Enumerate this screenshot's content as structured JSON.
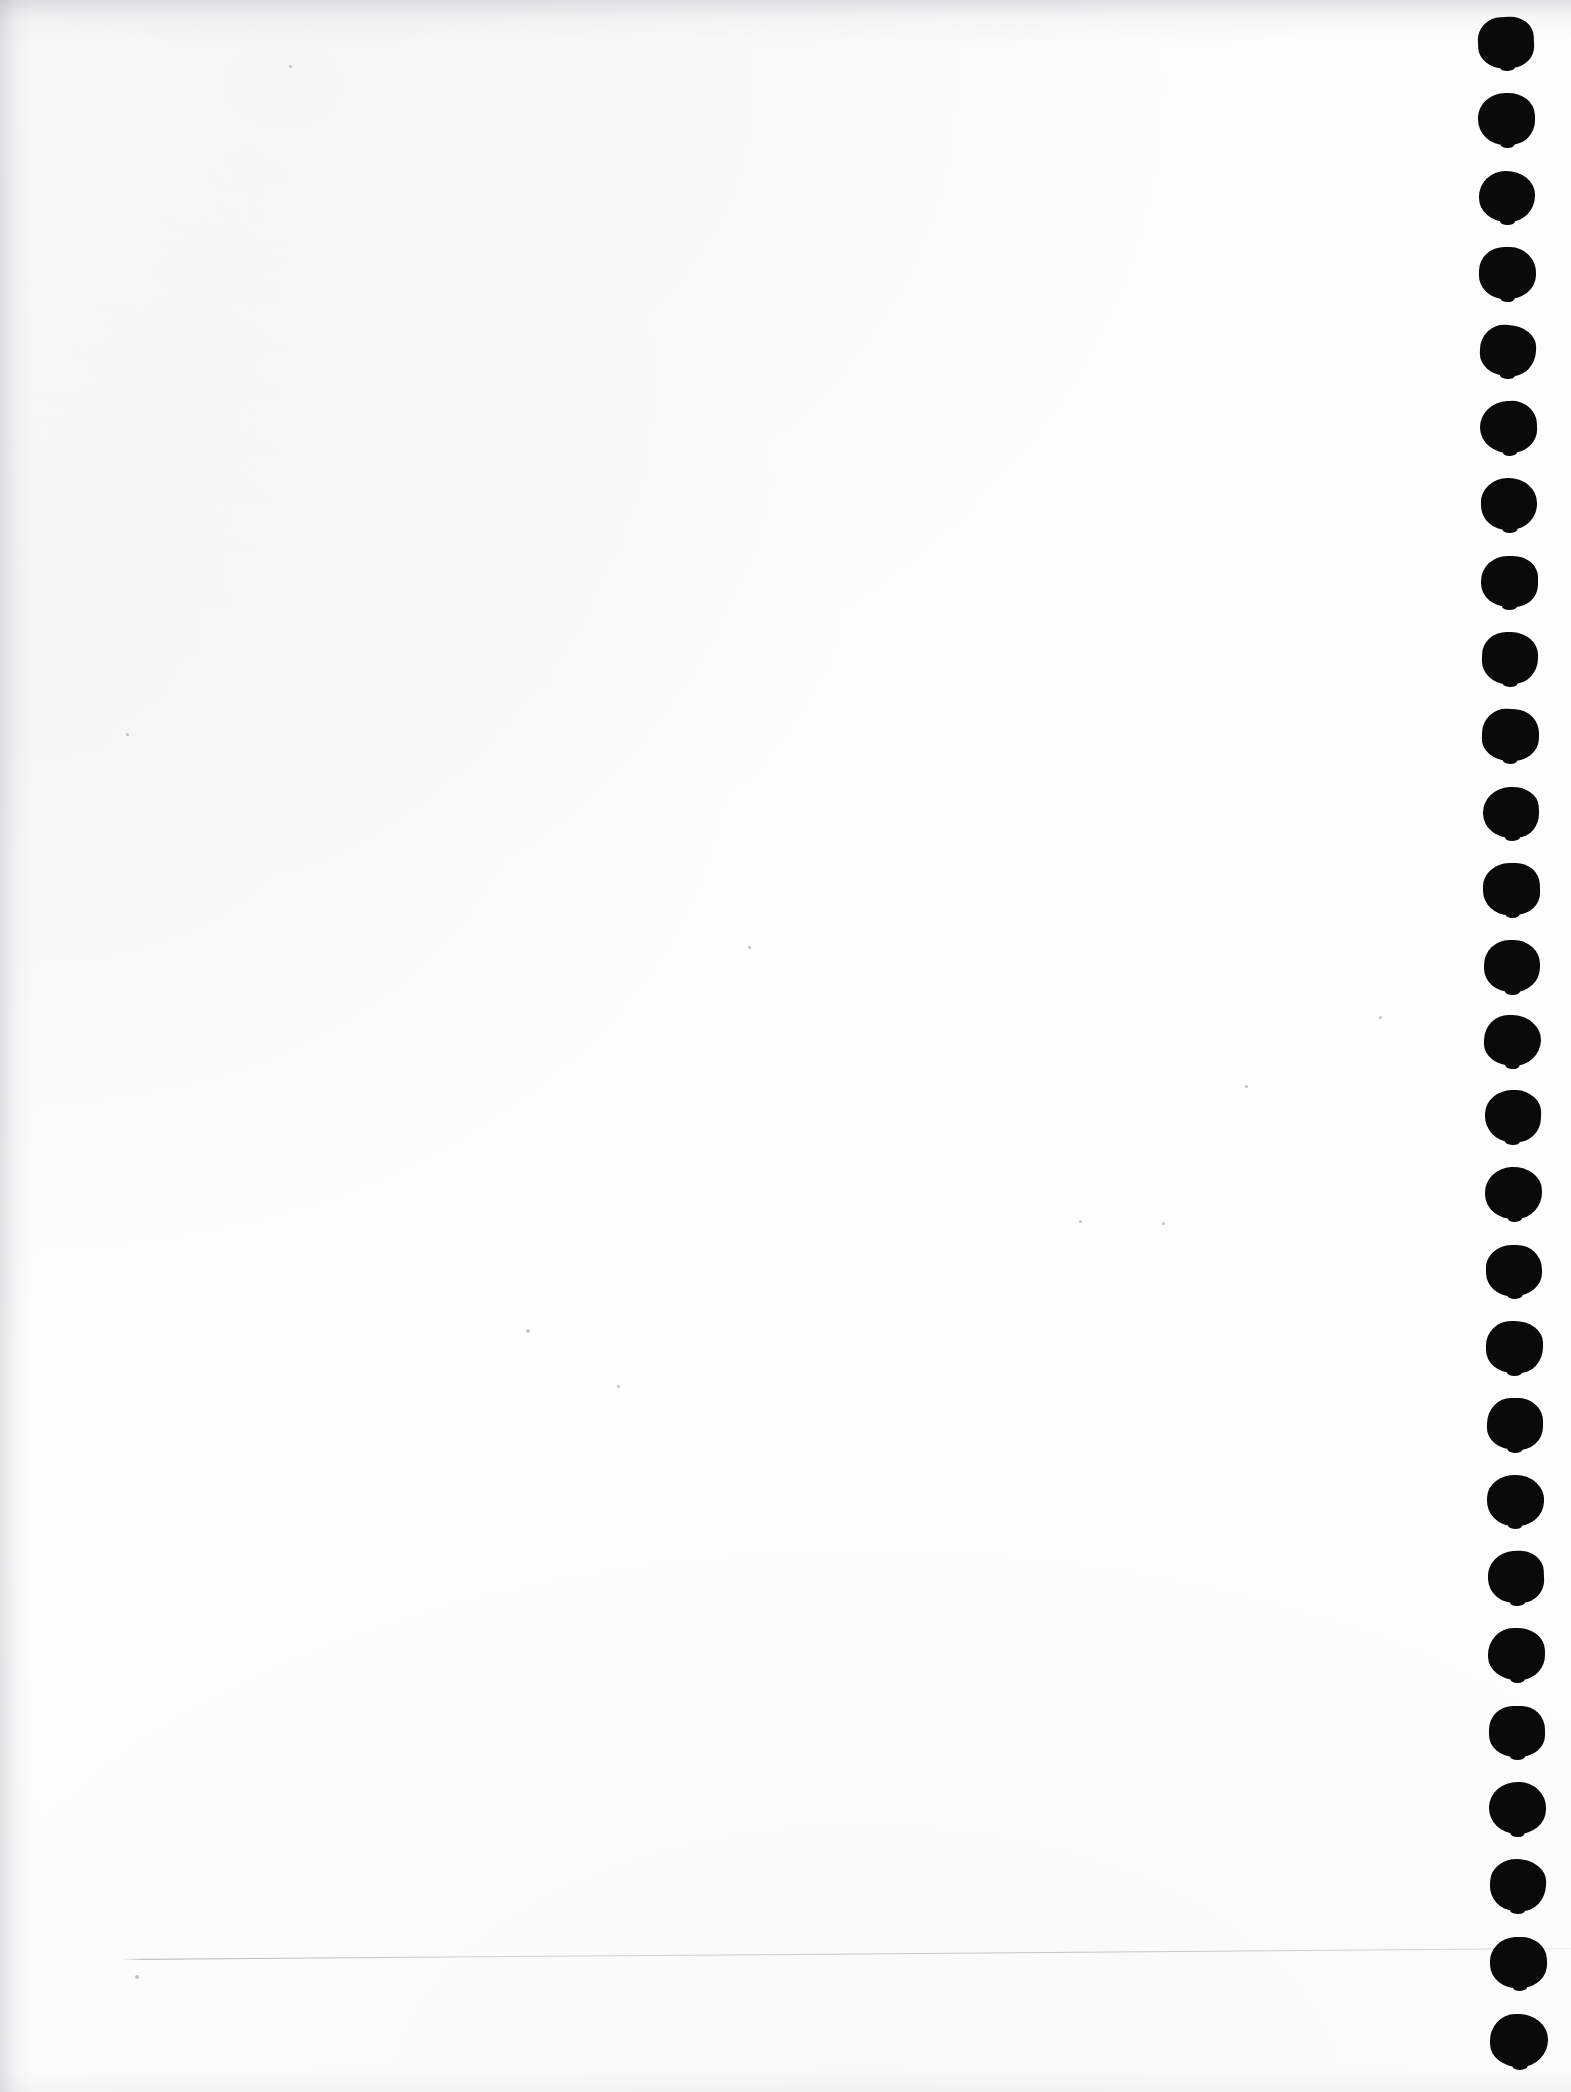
{
  "document": {
    "kind": "scanned-page",
    "description": "Blank scanned notebook page with punched binding holes along the right margin",
    "page_width": 1571,
    "page_height": 2092,
    "paper_color": "#fdfdfd",
    "ink_color": "#0a0a0a",
    "body_text": "",
    "visible_text": ""
  },
  "punch_holes": {
    "label": "binding punch holes",
    "count": 27,
    "shape": "rounded-blot",
    "color": "#0a0a0a",
    "first_center": {
      "x": 1507,
      "y": 42
    },
    "last_center": {
      "x": 1519,
      "y": 2040
    },
    "spacing_y": 76.8,
    "width": 57,
    "height": 52,
    "drift_x_total": 12,
    "dots": [
      {
        "cx": 1506,
        "cy": 42,
        "w": 56,
        "h": 51
      },
      {
        "cx": 1506,
        "cy": 119,
        "w": 57,
        "h": 52
      },
      {
        "cx": 1507,
        "cy": 196,
        "w": 56,
        "h": 51
      },
      {
        "cx": 1507,
        "cy": 273,
        "w": 57,
        "h": 52
      },
      {
        "cx": 1508,
        "cy": 350,
        "w": 56,
        "h": 51
      },
      {
        "cx": 1508,
        "cy": 427,
        "w": 57,
        "h": 52
      },
      {
        "cx": 1509,
        "cy": 504,
        "w": 56,
        "h": 52
      },
      {
        "cx": 1509,
        "cy": 581,
        "w": 57,
        "h": 51
      },
      {
        "cx": 1510,
        "cy": 658,
        "w": 56,
        "h": 52
      },
      {
        "cx": 1510,
        "cy": 735,
        "w": 57,
        "h": 52
      },
      {
        "cx": 1511,
        "cy": 812,
        "w": 56,
        "h": 51
      },
      {
        "cx": 1511,
        "cy": 889,
        "w": 57,
        "h": 52
      },
      {
        "cx": 1512,
        "cy": 966,
        "w": 56,
        "h": 52
      },
      {
        "cx": 1512,
        "cy": 1040,
        "w": 57,
        "h": 51
      },
      {
        "cx": 1513,
        "cy": 1116,
        "w": 56,
        "h": 52
      },
      {
        "cx": 1513,
        "cy": 1193,
        "w": 57,
        "h": 52
      },
      {
        "cx": 1514,
        "cy": 1270,
        "w": 56,
        "h": 51
      },
      {
        "cx": 1514,
        "cy": 1347,
        "w": 57,
        "h": 52
      },
      {
        "cx": 1515,
        "cy": 1424,
        "w": 56,
        "h": 52
      },
      {
        "cx": 1515,
        "cy": 1500,
        "w": 57,
        "h": 51
      },
      {
        "cx": 1516,
        "cy": 1577,
        "w": 56,
        "h": 52
      },
      {
        "cx": 1516,
        "cy": 1654,
        "w": 57,
        "h": 52
      },
      {
        "cx": 1517,
        "cy": 1731,
        "w": 56,
        "h": 51
      },
      {
        "cx": 1517,
        "cy": 1808,
        "w": 57,
        "h": 52
      },
      {
        "cx": 1518,
        "cy": 1885,
        "w": 56,
        "h": 52
      },
      {
        "cx": 1518,
        "cy": 1962,
        "w": 57,
        "h": 51
      },
      {
        "cx": 1519,
        "cy": 2040,
        "w": 58,
        "h": 53
      }
    ]
  },
  "hairline": {
    "label": "faint horizontal scan line",
    "x_start": 122,
    "x_end": 1571,
    "y_start": 1959,
    "y_end": 1948,
    "color": "#8a8f97"
  },
  "specks": [
    {
      "x": 135,
      "y": 1975,
      "d": 4
    },
    {
      "x": 126,
      "y": 733,
      "d": 3
    },
    {
      "x": 526,
      "y": 1329,
      "d": 4
    },
    {
      "x": 617,
      "y": 1385,
      "d": 3
    },
    {
      "x": 748,
      "y": 946,
      "d": 3
    },
    {
      "x": 1162,
      "y": 1222,
      "d": 3
    },
    {
      "x": 1245,
      "y": 1085,
      "d": 3
    },
    {
      "x": 1379,
      "y": 1016,
      "d": 3
    },
    {
      "x": 289,
      "y": 65,
      "d": 3
    },
    {
      "x": 1079,
      "y": 1220,
      "d": 3
    }
  ]
}
